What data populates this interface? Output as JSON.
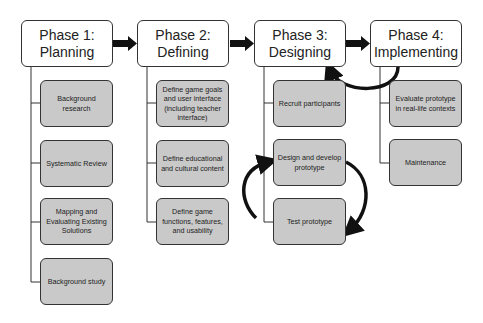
{
  "phases": [
    {
      "title": "Phase 1:\nPlanning",
      "title_line1": "Phase 1:",
      "title_line2": "Planning",
      "steps": [
        "Background research",
        "Systematic Review",
        "Mapping and Evaluating Existing Solutions",
        "Background study"
      ]
    },
    {
      "title_line1": "Phase 2:",
      "title_line2": "Defining",
      "steps": [
        "Define game goals and user interface (including teacher interface)",
        "Define educational and cultural content",
        "Define game functions, features, and usability"
      ]
    },
    {
      "title_line1": "Phase 3:",
      "title_line2": "Designing",
      "steps": [
        "Recruit participants",
        "Design and develop prototype",
        "Test prototype"
      ]
    },
    {
      "title_line1": "Phase 4:",
      "title_line2": "Implementing",
      "steps": [
        "Evaluate prototype in real-life contexts",
        "Maintenance"
      ]
    }
  ],
  "colors": {
    "phase_fill": "#ffffff",
    "step_fill": "#c9c9c9",
    "border": "#333333",
    "arrow": "#111111"
  }
}
